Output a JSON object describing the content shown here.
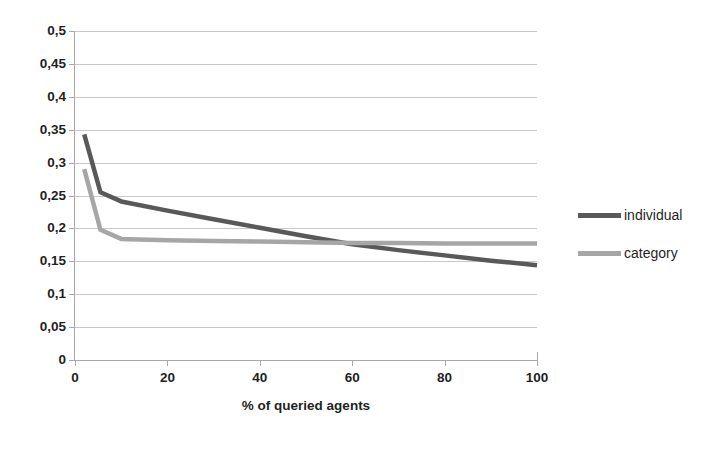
{
  "chart_data": {
    "type": "line",
    "title": "",
    "xlabel": "% of queried agents",
    "ylabel": "",
    "xlim": [
      0,
      100
    ],
    "ylim": [
      0,
      0.5
    ],
    "grid": true,
    "legend_position": "right",
    "decimal_separator": ",",
    "x_ticks": [
      "0",
      "20",
      "40",
      "60",
      "80",
      "100"
    ],
    "x_tick_values": [
      0,
      20,
      40,
      60,
      80,
      100
    ],
    "y_ticks": [
      "0",
      "0,05",
      "0,1",
      "0,15",
      "0,2",
      "0,25",
      "0,3",
      "0,35",
      "0,4",
      "0,45",
      "0,5"
    ],
    "y_tick_values": [
      0,
      0.05,
      0.1,
      0.15,
      0.2,
      0.25,
      0.3,
      0.35,
      0.4,
      0.45,
      0.5
    ],
    "series": [
      {
        "name": "individual",
        "color": "#595959",
        "x": [
          2,
          5.5,
          10,
          20,
          30,
          40,
          50,
          60,
          70,
          80,
          90,
          100
        ],
        "values": [
          0.343,
          0.255,
          0.241,
          0.227,
          0.214,
          0.201,
          0.188,
          0.176,
          0.167,
          0.159,
          0.151,
          0.144
        ]
      },
      {
        "name": "category",
        "color": "#a6a6a6",
        "x": [
          2,
          5.5,
          10,
          20,
          30,
          40,
          50,
          60,
          70,
          80,
          90,
          100
        ],
        "values": [
          0.29,
          0.198,
          0.184,
          0.182,
          0.181,
          0.18,
          0.179,
          0.178,
          0.178,
          0.177,
          0.177,
          0.177
        ]
      }
    ]
  },
  "legend": {
    "items": [
      {
        "label": "individual",
        "color": "#595959"
      },
      {
        "label": "category",
        "color": "#a6a6a6"
      }
    ]
  }
}
